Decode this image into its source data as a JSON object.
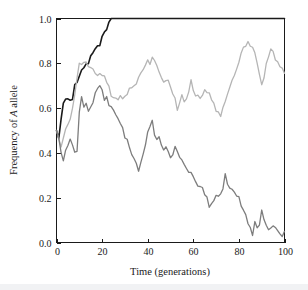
{
  "figure": {
    "name": "allele-frequency-drift-plot",
    "background_color": "#ffffff",
    "frame_color": "#1a1a1a"
  },
  "chart_data": {
    "type": "line",
    "title": "",
    "xlabel": "Time (generations)",
    "ylabel": "Frequency of A allele",
    "ylabel_italic_token": "A",
    "xlim": [
      0,
      100
    ],
    "ylim": [
      0.0,
      1.0
    ],
    "xticks": [
      0,
      20,
      40,
      60,
      80,
      100
    ],
    "xtick_labels": [
      "0",
      "20",
      "40",
      "60",
      "80",
      "100"
    ],
    "yticks": [
      0.0,
      0.2,
      0.4,
      0.6,
      0.8,
      1.0
    ],
    "ytick_labels": [
      "0.0",
      "0.2",
      "0.4",
      "0.6",
      "0.8",
      "1.0"
    ],
    "grid": false,
    "legend": false,
    "legend_position": "none",
    "tick_direction": "in",
    "series": [
      {
        "name": "population-1-fixation",
        "color": "#1a1a1a",
        "width": 1.6,
        "x": [
          0,
          1,
          2,
          3,
          4,
          5,
          6,
          7,
          8,
          9,
          10,
          11,
          12,
          13,
          14,
          15,
          16,
          17,
          18,
          19,
          20,
          21,
          22,
          23,
          24,
          25,
          30,
          40,
          50,
          60,
          70,
          80,
          90,
          100
        ],
        "values": [
          0.5,
          0.47,
          0.56,
          0.63,
          0.645,
          0.64,
          0.645,
          0.64,
          0.7,
          0.72,
          0.745,
          0.76,
          0.775,
          0.79,
          0.8,
          0.825,
          0.84,
          0.855,
          0.875,
          0.885,
          0.91,
          0.935,
          0.955,
          0.98,
          1.0,
          1.0,
          1.0,
          1.0,
          1.0,
          1.0,
          1.0,
          1.0,
          1.0,
          1.0
        ]
      },
      {
        "name": "population-2-polymorphic",
        "color": "#b5b5b5",
        "width": 1.3,
        "x": [
          0,
          1,
          2,
          3,
          4,
          5,
          6,
          7,
          8,
          9,
          10,
          11,
          12,
          13,
          14,
          15,
          16,
          17,
          18,
          19,
          20,
          21,
          22,
          23,
          24,
          25,
          26,
          27,
          28,
          29,
          30,
          31,
          32,
          33,
          34,
          35,
          36,
          37,
          38,
          39,
          40,
          41,
          42,
          43,
          44,
          45,
          46,
          47,
          48,
          49,
          50,
          51,
          52,
          53,
          54,
          55,
          56,
          57,
          58,
          59,
          60,
          61,
          62,
          63,
          64,
          65,
          66,
          67,
          68,
          69,
          70,
          71,
          72,
          73,
          74,
          75,
          76,
          77,
          78,
          79,
          80,
          81,
          82,
          83,
          84,
          85,
          86,
          87,
          88,
          89,
          90,
          91,
          92,
          93,
          94,
          95,
          96,
          97,
          98,
          99,
          100
        ],
        "values": [
          0.5,
          0.455,
          0.43,
          0.46,
          0.5,
          0.52,
          0.555,
          0.6,
          0.655,
          0.725,
          0.8,
          0.79,
          0.815,
          0.795,
          0.785,
          0.78,
          0.775,
          0.765,
          0.74,
          0.745,
          0.755,
          0.735,
          0.715,
          0.69,
          0.66,
          0.655,
          0.645,
          0.64,
          0.65,
          0.635,
          0.655,
          0.67,
          0.685,
          0.7,
          0.695,
          0.715,
          0.73,
          0.75,
          0.775,
          0.795,
          0.805,
          0.795,
          0.83,
          0.81,
          0.78,
          0.755,
          0.735,
          0.72,
          0.73,
          0.715,
          0.69,
          0.67,
          0.645,
          0.6,
          0.625,
          0.655,
          0.63,
          0.645,
          0.665,
          0.72,
          0.685,
          0.655,
          0.65,
          0.635,
          0.655,
          0.685,
          0.675,
          0.665,
          0.645,
          0.615,
          0.595,
          0.58,
          0.565,
          0.6,
          0.63,
          0.665,
          0.69,
          0.715,
          0.745,
          0.78,
          0.815,
          0.845,
          0.865,
          0.875,
          0.89,
          0.885,
          0.865,
          0.84,
          0.8,
          0.745,
          0.715,
          0.745,
          0.79,
          0.82,
          0.855,
          0.845,
          0.82,
          0.8,
          0.785,
          0.77,
          0.755
        ]
      },
      {
        "name": "population-3-declining",
        "color": "#7d7d7d",
        "width": 1.3,
        "x": [
          0,
          1,
          2,
          3,
          4,
          5,
          6,
          7,
          8,
          9,
          10,
          11,
          12,
          13,
          14,
          15,
          16,
          17,
          18,
          19,
          20,
          21,
          22,
          23,
          24,
          25,
          26,
          27,
          28,
          29,
          30,
          31,
          32,
          33,
          34,
          35,
          36,
          37,
          38,
          39,
          40,
          41,
          42,
          43,
          44,
          45,
          46,
          47,
          48,
          49,
          50,
          51,
          52,
          53,
          54,
          55,
          56,
          57,
          58,
          59,
          60,
          61,
          62,
          63,
          64,
          65,
          66,
          67,
          68,
          69,
          70,
          71,
          72,
          73,
          74,
          75,
          76,
          77,
          78,
          79,
          80,
          81,
          82,
          83,
          84,
          85,
          86,
          87,
          88,
          89,
          90,
          91,
          92,
          93,
          94,
          95,
          96,
          97,
          98,
          99,
          100
        ],
        "values": [
          0.5,
          0.46,
          0.4,
          0.375,
          0.415,
          0.44,
          0.46,
          0.425,
          0.405,
          0.41,
          0.58,
          0.655,
          0.6,
          0.615,
          0.585,
          0.605,
          0.625,
          0.66,
          0.695,
          0.705,
          0.675,
          0.645,
          0.655,
          0.62,
          0.6,
          0.585,
          0.565,
          0.545,
          0.535,
          0.505,
          0.475,
          0.455,
          0.425,
          0.4,
          0.385,
          0.345,
          0.315,
          0.355,
          0.395,
          0.445,
          0.49,
          0.525,
          0.535,
          0.49,
          0.455,
          0.465,
          0.435,
          0.405,
          0.42,
          0.4,
          0.385,
          0.395,
          0.42,
          0.4,
          0.375,
          0.365,
          0.345,
          0.325,
          0.315,
          0.305,
          0.29,
          0.265,
          0.255,
          0.26,
          0.235,
          0.215,
          0.195,
          0.165,
          0.175,
          0.195,
          0.205,
          0.2,
          0.22,
          0.245,
          0.31,
          0.255,
          0.235,
          0.24,
          0.22,
          0.205,
          0.195,
          0.165,
          0.145,
          0.12,
          0.09,
          0.075,
          0.035,
          0.085,
          0.065,
          0.085,
          0.15,
          0.105,
          0.075,
          0.065,
          0.07,
          0.065,
          0.06,
          0.055,
          0.045,
          0.035,
          0.05
        ]
      }
    ]
  }
}
